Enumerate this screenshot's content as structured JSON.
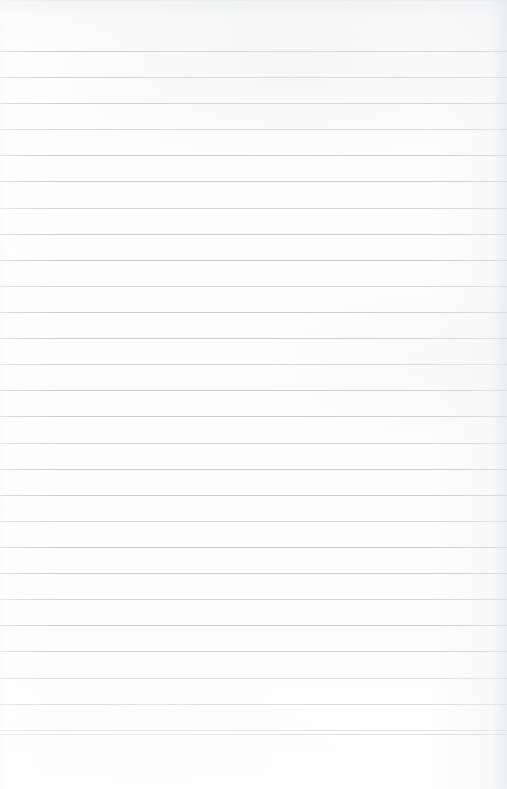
{
  "document": {
    "kind": "blank-ruled-paper",
    "description": "Blank sheet of ruled notebook paper, no handwriting or printed text",
    "width_px": 507,
    "height_px": 789,
    "content_text": "",
    "page_number": "",
    "header_text": "",
    "footer_text": ""
  },
  "paper": {
    "background_color": "#fdfdfd",
    "base_tone_color": "#fcfcfc",
    "edge_shadow_color": "#e4e6e9",
    "rule_color": "#c8cbd0",
    "rule_color_light": "#d2d5d9",
    "rule_color_dark": "#bfc3c8",
    "rule_thickness_px": 1,
    "rule_spacing_px": 26.1,
    "first_rule_y_px": 51,
    "last_rule_y_px": 734,
    "rule_count": 28,
    "left_margin_rule": "none",
    "bottom_blank_margin_px": 55
  },
  "rules": [
    {
      "index": 1,
      "y": 51,
      "tone": "darker"
    },
    {
      "index": 2,
      "y": 77,
      "tone": "normal"
    },
    {
      "index": 3,
      "y": 103,
      "tone": "normal"
    },
    {
      "index": 4,
      "y": 129,
      "tone": "lighter"
    },
    {
      "index": 5,
      "y": 155,
      "tone": "normal"
    },
    {
      "index": 6,
      "y": 181,
      "tone": "normal"
    },
    {
      "index": 7,
      "y": 208,
      "tone": "lighter"
    },
    {
      "index": 8,
      "y": 234,
      "tone": "normal"
    },
    {
      "index": 9,
      "y": 260,
      "tone": "normal"
    },
    {
      "index": 10,
      "y": 286,
      "tone": "lighter"
    },
    {
      "index": 11,
      "y": 312,
      "tone": "normal"
    },
    {
      "index": 12,
      "y": 338,
      "tone": "normal"
    },
    {
      "index": 13,
      "y": 364,
      "tone": "lighter"
    },
    {
      "index": 14,
      "y": 390,
      "tone": "normal"
    },
    {
      "index": 15,
      "y": 416,
      "tone": "normal"
    },
    {
      "index": 16,
      "y": 443,
      "tone": "lighter"
    },
    {
      "index": 17,
      "y": 469,
      "tone": "normal"
    },
    {
      "index": 18,
      "y": 495,
      "tone": "normal"
    },
    {
      "index": 19,
      "y": 521,
      "tone": "lighter"
    },
    {
      "index": 20,
      "y": 547,
      "tone": "normal"
    },
    {
      "index": 21,
      "y": 573,
      "tone": "normal"
    },
    {
      "index": 22,
      "y": 599,
      "tone": "lighter"
    },
    {
      "index": 23,
      "y": 625,
      "tone": "normal"
    },
    {
      "index": 24,
      "y": 651,
      "tone": "normal"
    },
    {
      "index": 25,
      "y": 678,
      "tone": "lighter"
    },
    {
      "index": 26,
      "y": 704,
      "tone": "normal"
    },
    {
      "index": 27,
      "y": 730,
      "tone": "normal"
    },
    {
      "index": 28,
      "y": 734,
      "tone": "darker"
    }
  ]
}
